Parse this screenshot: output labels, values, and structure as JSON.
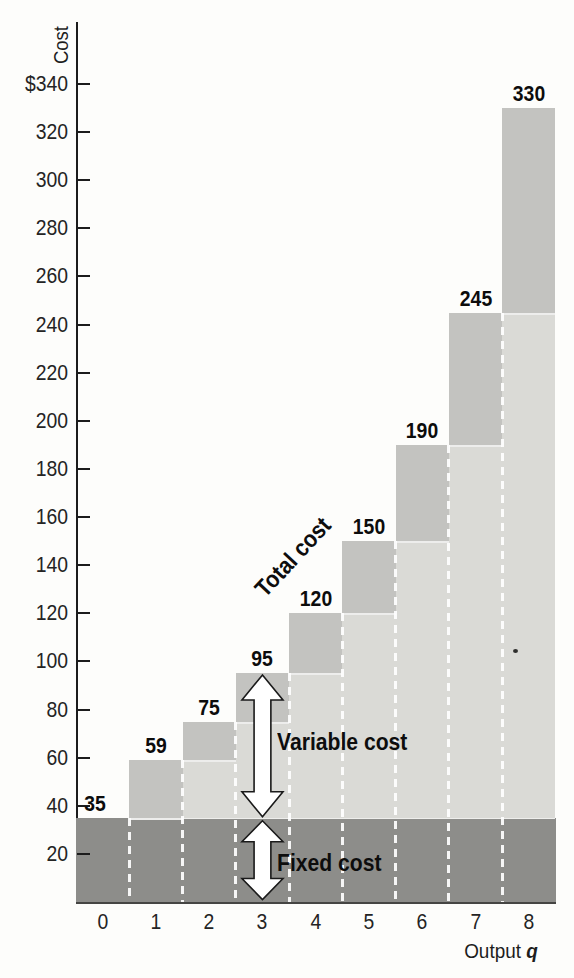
{
  "figure": {
    "y_axis_title": "Cost",
    "x_axis_title": "Output",
    "x_axis_variable": "q"
  },
  "chart_data": {
    "type": "bar",
    "title": "",
    "ylabel": "Cost",
    "xlabel": "Output q",
    "categories": [
      "0",
      "1",
      "2",
      "3",
      "4",
      "5",
      "6",
      "7",
      "8"
    ],
    "total_cost": [
      35,
      59,
      75,
      95,
      120,
      150,
      190,
      245,
      330
    ],
    "fixed_cost": 35,
    "series": [
      {
        "name": "Fixed cost",
        "values": [
          35,
          35,
          35,
          35,
          35,
          35,
          35,
          35,
          35
        ]
      },
      {
        "name": "Variable cost",
        "values": [
          0,
          24,
          40,
          60,
          85,
          115,
          155,
          210,
          295
        ]
      }
    ],
    "bar_value_labels": [
      "35",
      "59",
      "75",
      "95",
      "120",
      "150",
      "190",
      "245",
      "330"
    ],
    "x_tick_labels": [
      "0",
      "1",
      "2",
      "3",
      "4",
      "5",
      "6",
      "7",
      "8"
    ],
    "y_tick_labels": [
      "20",
      "40",
      "60",
      "80",
      "100",
      "120",
      "140",
      "160",
      "180",
      "200",
      "220",
      "240",
      "260",
      "280",
      "300",
      "320",
      "$340"
    ],
    "y_axis": {
      "min": 0,
      "max": 340,
      "tick_step": 20
    },
    "annotations": {
      "total_cost": "Total cost",
      "variable_cost": "Variable cost",
      "fixed_cost": "Fixed cost"
    },
    "arrow_at_output": 3,
    "legend": false,
    "grid": false,
    "colors": {
      "fixed_band": "#8d8d8a",
      "variable_light": "#dadad6",
      "marginal_medium": "#c3c3c0",
      "arrow_fill": "#ffffff",
      "arrow_outline": "#1a1a1a",
      "axis": "#1c1c1c",
      "text": "#161616"
    }
  }
}
